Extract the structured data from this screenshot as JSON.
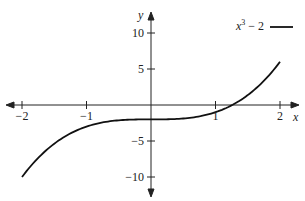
{
  "chart_data": {
    "type": "line",
    "title": "",
    "xlabel": "x",
    "ylabel": "y",
    "xlim": [
      -2.2,
      2.3
    ],
    "ylim": [
      -12,
      12
    ],
    "grid": false,
    "legend_position": "top-right",
    "x_ticks": [
      -2,
      -1,
      1,
      2
    ],
    "x_tick_labels": [
      "−2",
      "−1",
      "1",
      "2"
    ],
    "y_ticks": [
      10,
      5,
      -5,
      -10
    ],
    "y_tick_labels": [
      "10",
      "5",
      "−5",
      "−10"
    ],
    "series": [
      {
        "name": "x³ − 2",
        "function": "x^3 - 2",
        "color": "#111111",
        "x": [
          -2,
          -1.5,
          -1,
          -0.5,
          0,
          0.5,
          1,
          1.26,
          1.5,
          2
        ],
        "y": [
          -10,
          -5.375,
          -3,
          -2.125,
          -2,
          -1.875,
          -1,
          0,
          1.375,
          6
        ]
      }
    ]
  },
  "legend": {
    "label_base": "x",
    "label_exp": "3",
    "label_rest": " − 2"
  }
}
